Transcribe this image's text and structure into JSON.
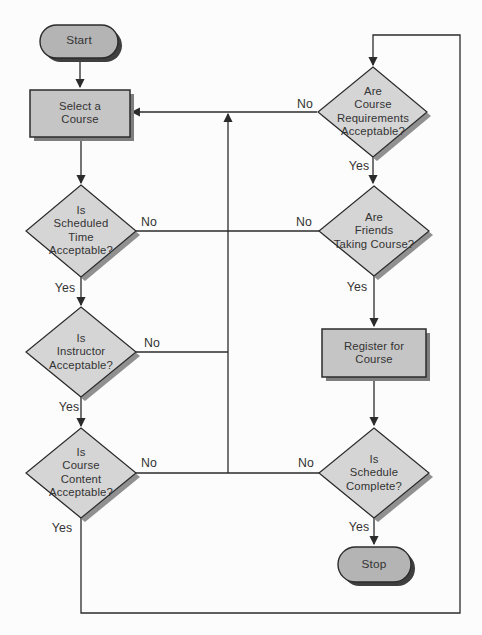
{
  "colors": {
    "background": "#fcfcfc",
    "line": "#2b2b2b",
    "border": "#2b2b2b",
    "text": "#333333",
    "diamond_fill": "#d5d5d5",
    "process_fill": "#c5c5c5",
    "terminator_fill": "#b4b4b4",
    "diamond_shadow": "#909090",
    "process_shadow": "#7e7e7e",
    "terminator_shadow": "#3f3f3f"
  },
  "nodes": {
    "start": "Start",
    "select_course": "Select a\nCourse",
    "scheduled_time": "Is\nScheduled\nTime\nAcceptable?",
    "instructor": "Is\nInstructor\nAcceptable?",
    "course_content": "Is\nCourse\nContent\nAcceptable?",
    "course_requirements": "Are\nCourse\nRequirements\nAcceptable?",
    "friends_taking": "Are\nFriends\nTaking Course?",
    "register": "Register for\nCourse",
    "schedule_complete": "Is\nSchedule\nComplete?",
    "stop": "Stop"
  },
  "edge_labels": {
    "scheduled_time_no": "No",
    "scheduled_time_yes": "Yes",
    "instructor_no": "No",
    "instructor_yes": "Yes",
    "course_content_no": "No",
    "course_content_yes": "Yes",
    "course_requirements_no": "No",
    "course_requirements_yes": "Yes",
    "friends_taking_no": "No",
    "friends_taking_yes": "Yes",
    "schedule_complete_no": "No",
    "schedule_complete_yes": "Yes"
  }
}
